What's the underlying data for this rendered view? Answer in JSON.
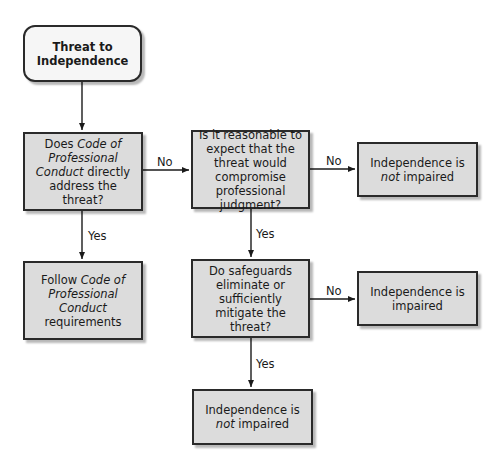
{
  "diagram": {
    "type": "flowchart",
    "nodes": {
      "start": {
        "shape": "rounded-rect",
        "line1": "Threat to",
        "line2": "Independence"
      },
      "q_code": {
        "shape": "rect",
        "parts": [
          "Does ",
          "Code of",
          " ",
          "Professional Conduct",
          " directly address the threat?"
        ]
      },
      "q_reasonable": {
        "shape": "rect",
        "text": "Is it reasonable to expect that the threat would compromise professional judgment?"
      },
      "r_not_impaired_top": {
        "shape": "rect",
        "pre": "Independence is ",
        "em": "not",
        "post": " impaired"
      },
      "r_follow_code": {
        "shape": "rect",
        "pre": "Follow ",
        "em": "Code of Professional Conduct",
        "post": " requirements"
      },
      "q_safeguards": {
        "shape": "rect",
        "text": "Do safeguards eliminate or sufficiently mitigate the threat?"
      },
      "r_impaired": {
        "shape": "rect",
        "text": "Independence is impaired"
      },
      "r_not_impaired_bottom": {
        "shape": "rect",
        "pre": "Independence is ",
        "em": "not",
        "post": " impaired"
      }
    },
    "edges": [
      {
        "from": "start",
        "to": "q_code",
        "label": ""
      },
      {
        "from": "q_code",
        "to": "q_reasonable",
        "label": "No"
      },
      {
        "from": "q_code",
        "to": "r_follow_code",
        "label": "Yes"
      },
      {
        "from": "q_reasonable",
        "to": "r_not_impaired_top",
        "label": "No"
      },
      {
        "from": "q_reasonable",
        "to": "q_safeguards",
        "label": "Yes"
      },
      {
        "from": "q_safeguards",
        "to": "r_impaired",
        "label": "No"
      },
      {
        "from": "q_safeguards",
        "to": "r_not_impaired_bottom",
        "label": "Yes"
      }
    ],
    "edge_labels": {
      "code_no": "No",
      "code_yes": "Yes",
      "reasonable_no": "No",
      "reasonable_yes": "Yes",
      "safeguards_no": "No",
      "safeguards_yes": "Yes"
    },
    "colors": {
      "box_fill": "#dcdcdc",
      "start_fill": "#f6f6f6",
      "stroke": "#2a2a2a"
    }
  }
}
